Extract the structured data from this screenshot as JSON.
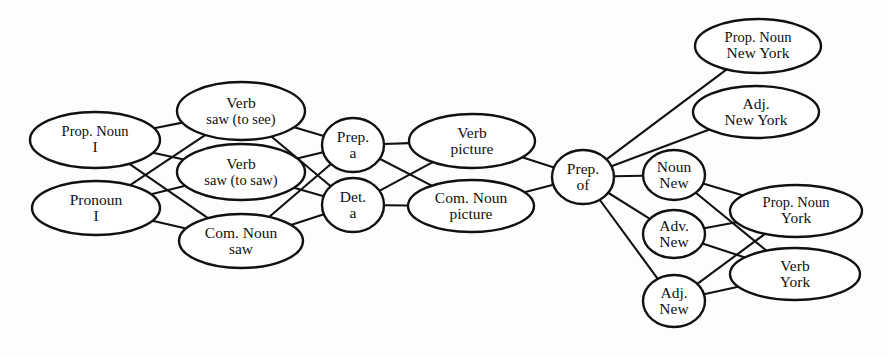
{
  "figure": {
    "type": "word-lattice-diagram",
    "title": "",
    "stroke_color": "#111111",
    "fill_color": "#ffffff",
    "background_color": "#fdfdfc"
  },
  "nodes": [
    {
      "id": "n1",
      "line1": "Prop. Noun",
      "line2": "I",
      "shape": "ellipse",
      "cx": 95,
      "cy": 140,
      "rx": 65,
      "ry": 28,
      "column": 0
    },
    {
      "id": "n2",
      "line1": "Pronoun",
      "line2": "I",
      "shape": "ellipse",
      "cx": 96,
      "cy": 208,
      "rx": 64,
      "ry": 27,
      "column": 0
    },
    {
      "id": "n3",
      "line1": "Verb",
      "line2": "saw (to see)",
      "shape": "ellipse",
      "cx": 241,
      "cy": 111,
      "rx": 64,
      "ry": 29,
      "column": 1
    },
    {
      "id": "n4",
      "line1": "Verb",
      "line2": "saw (to saw)",
      "shape": "ellipse",
      "cx": 241,
      "cy": 172,
      "rx": 64,
      "ry": 28,
      "column": 1
    },
    {
      "id": "n5",
      "line1": "Com. Noun",
      "line2": "saw",
      "shape": "ellipse",
      "cx": 241,
      "cy": 241,
      "rx": 62,
      "ry": 27,
      "column": 1
    },
    {
      "id": "n6",
      "line1": "Prep.",
      "line2": "a",
      "shape": "circle",
      "cx": 353,
      "cy": 145,
      "rx": 31,
      "ry": 27,
      "column": 2
    },
    {
      "id": "n7",
      "line1": "Det.",
      "line2": "a",
      "shape": "circle",
      "cx": 353,
      "cy": 205,
      "rx": 31,
      "ry": 27,
      "column": 2
    },
    {
      "id": "n8",
      "line1": "Verb",
      "line2": "picture",
      "shape": "ellipse",
      "cx": 472,
      "cy": 141,
      "rx": 63,
      "ry": 27,
      "column": 3
    },
    {
      "id": "n9",
      "line1": "Com. Noun",
      "line2": "picture",
      "shape": "ellipse",
      "cx": 471,
      "cy": 206,
      "rx": 63,
      "ry": 26,
      "column": 3
    },
    {
      "id": "n10",
      "line1": "Prep.",
      "line2": "of",
      "shape": "circle",
      "cx": 583,
      "cy": 177,
      "rx": 31,
      "ry": 27,
      "column": 4
    },
    {
      "id": "n11",
      "line1": "Prop. Noun",
      "line2": "New York",
      "shape": "ellipse",
      "cx": 758,
      "cy": 46,
      "rx": 63,
      "ry": 27,
      "column": 5
    },
    {
      "id": "n12",
      "line1": "Adj.",
      "line2": "New York",
      "shape": "ellipse",
      "cx": 756,
      "cy": 112,
      "rx": 63,
      "ry": 26,
      "column": 5
    },
    {
      "id": "n13",
      "line1": "Noun",
      "line2": "New",
      "shape": "circle",
      "cx": 674,
      "cy": 175,
      "rx": 31,
      "ry": 25,
      "column": 5
    },
    {
      "id": "n14",
      "line1": "Adv.",
      "line2": "New",
      "shape": "circle",
      "cx": 674,
      "cy": 234,
      "rx": 31,
      "ry": 24,
      "column": 5
    },
    {
      "id": "n15",
      "line1": "Adj.",
      "line2": "New",
      "shape": "circle",
      "cx": 674,
      "cy": 301,
      "rx": 31,
      "ry": 26,
      "column": 5
    },
    {
      "id": "n16",
      "line1": "Prop. Noun",
      "line2": "York",
      "shape": "ellipse",
      "cx": 796,
      "cy": 211,
      "rx": 66,
      "ry": 26,
      "column": 6
    },
    {
      "id": "n17",
      "line1": "Verb",
      "line2": "York",
      "shape": "ellipse",
      "cx": 795,
      "cy": 274,
      "rx": 65,
      "ry": 26,
      "column": 6
    }
  ],
  "edges": [
    {
      "from": "n1",
      "to": "n3"
    },
    {
      "from": "n1",
      "to": "n4"
    },
    {
      "from": "n1",
      "to": "n5"
    },
    {
      "from": "n2",
      "to": "n3"
    },
    {
      "from": "n2",
      "to": "n4"
    },
    {
      "from": "n2",
      "to": "n5"
    },
    {
      "from": "n3",
      "to": "n6"
    },
    {
      "from": "n3",
      "to": "n7"
    },
    {
      "from": "n4",
      "to": "n6"
    },
    {
      "from": "n4",
      "to": "n7"
    },
    {
      "from": "n5",
      "to": "n6"
    },
    {
      "from": "n5",
      "to": "n7"
    },
    {
      "from": "n6",
      "to": "n8"
    },
    {
      "from": "n6",
      "to": "n9"
    },
    {
      "from": "n7",
      "to": "n8"
    },
    {
      "from": "n7",
      "to": "n9"
    },
    {
      "from": "n8",
      "to": "n10"
    },
    {
      "from": "n9",
      "to": "n10"
    },
    {
      "from": "n10",
      "to": "n11"
    },
    {
      "from": "n10",
      "to": "n12"
    },
    {
      "from": "n10",
      "to": "n13"
    },
    {
      "from": "n10",
      "to": "n14"
    },
    {
      "from": "n10",
      "to": "n15"
    },
    {
      "from": "n13",
      "to": "n16"
    },
    {
      "from": "n13",
      "to": "n17"
    },
    {
      "from": "n14",
      "to": "n16"
    },
    {
      "from": "n14",
      "to": "n17"
    },
    {
      "from": "n15",
      "to": "n16"
    },
    {
      "from": "n15",
      "to": "n17"
    }
  ]
}
